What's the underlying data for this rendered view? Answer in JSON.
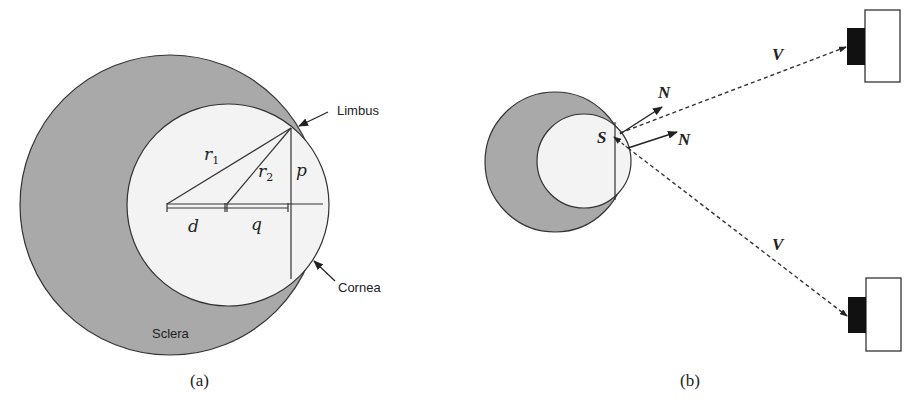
{
  "figure": {
    "panel_a": {
      "caption": "(a)",
      "labels": {
        "limbus": "Limbus",
        "cornea": "Cornea",
        "sclera": "Sclera",
        "r1": "r",
        "r1_sub": "1",
        "r2": "r",
        "r2_sub": "2",
        "p": "p",
        "d": "d",
        "q": "q"
      }
    },
    "panel_b": {
      "caption": "(b)",
      "labels": {
        "s": "S",
        "n_top": "N",
        "n_bottom": "N",
        "v_top": "V",
        "v_bottom": "V"
      }
    },
    "colors": {
      "sclera_fill": "#a9a9a9",
      "cornea_fill": "#f3f3f3",
      "stroke": "#333333",
      "camera_lens": "#111111"
    }
  }
}
